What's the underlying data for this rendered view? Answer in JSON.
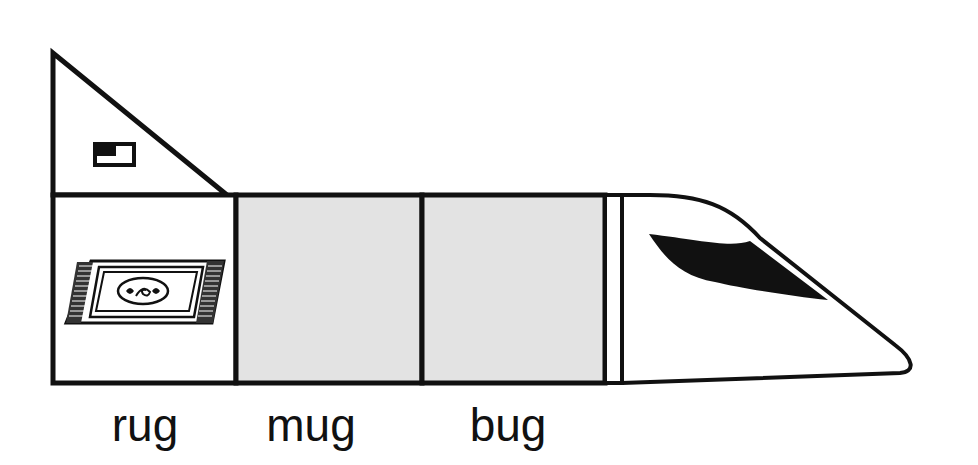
{
  "diagram": {
    "cars": [
      {
        "id": "car-1",
        "word": "rug",
        "picture": "rug",
        "filled": true
      },
      {
        "id": "car-2",
        "word": "mug",
        "picture": "",
        "filled": false
      },
      {
        "id": "car-3",
        "word": "bug",
        "picture": "",
        "filled": false
      }
    ],
    "engine": {
      "part": "locomotive-nose",
      "window": "windshield"
    },
    "tail": {
      "part": "triangular-tail",
      "icon": "small-flag-icon"
    }
  },
  "colors": {
    "outline": "#111111",
    "empty_car_fill": "#e3e3e3",
    "background": "#ffffff"
  }
}
